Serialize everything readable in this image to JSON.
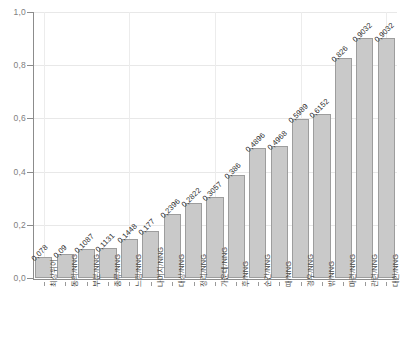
{
  "chart_data": {
    "type": "bar",
    "title": "",
    "subtitle": "",
    "xlabel": "",
    "ylabel": "",
    "ylim": [
      0.0,
      1.0
    ],
    "grid": true,
    "legend": false,
    "legend_position": "none",
    "decimal_separator": ",",
    "orientation": "vertical",
    "bar_color": "#c9c9c9",
    "bar_edge_color": "#9d9d9d",
    "axis_color": "#8c8c8c",
    "grid_color": "#e8e8e8",
    "y_ticks": [
      "0,0",
      "0,2",
      "0,4",
      "0,6",
      "0,8",
      "1,0"
    ],
    "y_tick_values": [
      0.0,
      0.2,
      0.4,
      0.6,
      0.8,
      1.0
    ],
    "categories": [
      "최상위어",
      "동의/NNG",
      "부분/NNG",
      "종류/NNG",
      "느낌/NNG",
      "나머지/NNG",
      "대상/NNG",
      "정리/NNG",
      "가운데/NNG",
      "후/NNG",
      "순간/NNG",
      "때/NNG",
      "경우/NNG",
      "밖/NNG",
      "마련/NNG",
      "관련/NNG",
      "대한/NNG"
    ],
    "values": [
      0.078,
      0.09,
      0.1087,
      0.1131,
      0.1448,
      0.177,
      0.2396,
      0.2822,
      0.3057,
      0.386,
      0.4896,
      0.4968,
      0.5989,
      0.6152,
      0.826,
      0.9032,
      0.9032
    ],
    "value_labels": [
      "0,078",
      "0,09",
      "0,1087",
      "0,1131",
      "0,1448",
      "0,177",
      "0,2396",
      "0,2822",
      "0,3057",
      "0,386",
      "0,4896",
      "0,4968",
      "0,5989",
      "0,6152",
      "0,826",
      "0,9032",
      "0,9032"
    ],
    "n_bars": 17
  }
}
